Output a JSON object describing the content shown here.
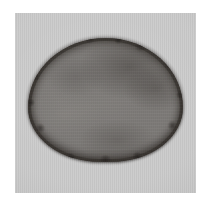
{
  "figure": {
    "kind": "micrograph",
    "modality": "grayscale light micrograph",
    "caption": "",
    "background_color": "#ffffff"
  },
  "panel": {
    "name": "micrograph field",
    "background_color": "#c9c9c9",
    "x": 15,
    "y": 13,
    "width": 181,
    "height": 180
  },
  "specimen": {
    "label": "",
    "shape": "rounded ovoid",
    "interior_color": "#7d7a77",
    "rim_color": "#2e2925",
    "x": 28,
    "y": 38,
    "width": 155,
    "height": 124
  }
}
